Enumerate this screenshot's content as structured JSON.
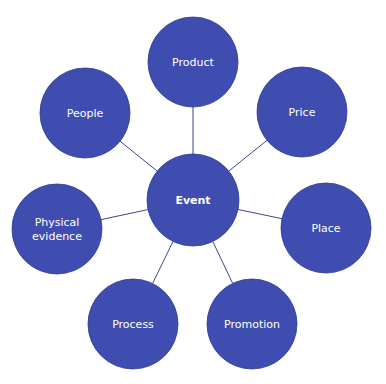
{
  "diagram": {
    "type": "hub-and-spoke",
    "colors": {
      "node_fill": "#3f4db0",
      "node_stroke": "#2f3c94",
      "edge": "#3a4596",
      "text": "#ffffff",
      "background": "#ffffff"
    },
    "center": {
      "label": "Event",
      "cx": 193,
      "cy": 200,
      "r": 46
    },
    "nodes": [
      {
        "id": "product",
        "lines": [
          "Product"
        ],
        "cx": 193,
        "cy": 62,
        "r": 45
      },
      {
        "id": "price",
        "lines": [
          "Price"
        ],
        "cx": 302,
        "cy": 112,
        "r": 45
      },
      {
        "id": "place",
        "lines": [
          "Place"
        ],
        "cx": 326,
        "cy": 228,
        "r": 45
      },
      {
        "id": "promotion",
        "lines": [
          "Promotion"
        ],
        "cx": 252,
        "cy": 324,
        "r": 45
      },
      {
        "id": "process",
        "lines": [
          "Process"
        ],
        "cx": 133,
        "cy": 324,
        "r": 45
      },
      {
        "id": "physical-evidence",
        "lines": [
          "Physical",
          "evidence"
        ],
        "cx": 57,
        "cy": 229,
        "r": 45
      },
      {
        "id": "people",
        "lines": [
          "People"
        ],
        "cx": 85,
        "cy": 113,
        "r": 45
      }
    ]
  }
}
